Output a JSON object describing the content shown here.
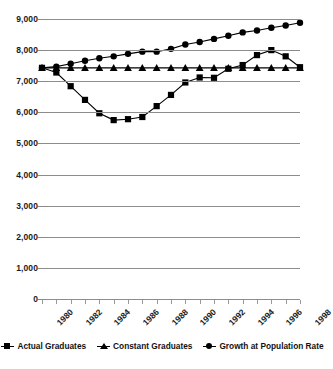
{
  "chart_data": {
    "type": "line",
    "title": "",
    "subtitle": "",
    "xlabel": "",
    "ylabel": "",
    "grid": true,
    "legend_position": "bottom",
    "x": [
      1980,
      1981,
      1982,
      1983,
      1984,
      1985,
      1986,
      1987,
      1988,
      1989,
      1990,
      1991,
      1992,
      1993,
      1994,
      1995,
      1996,
      1997,
      1998
    ],
    "categories": [
      "1980",
      "1981",
      "1982",
      "1983",
      "1984",
      "1985",
      "1986",
      "1987",
      "1988",
      "1989",
      "1990",
      "1991",
      "1992",
      "1993",
      "1994",
      "1995",
      "1996",
      "1997",
      "1998"
    ],
    "xtick_labels": [
      "1980",
      "1982",
      "1984",
      "1986",
      "1988",
      "1990",
      "1992",
      "1994",
      "1996",
      "1998"
    ],
    "xtick_values": [
      1980,
      1982,
      1984,
      1986,
      1988,
      1990,
      1992,
      1994,
      1996,
      1998
    ],
    "ytick_labels": [
      "9,000",
      "8,000",
      "7,000",
      "6,000",
      "5,000",
      "4,000",
      "3,000",
      "2,000",
      "1,000",
      "0"
    ],
    "ytick_values": [
      9000,
      8000,
      7000,
      6000,
      5000,
      4000,
      3000,
      2000,
      1000,
      0
    ],
    "ylim": [
      0,
      9000
    ],
    "xlim": [
      1980,
      1998
    ],
    "series": [
      {
        "name": "Actual Graduates",
        "marker": "square",
        "color": "#000000",
        "values": [
          7430,
          7280,
          6840,
          6400,
          5970,
          5750,
          5780,
          5850,
          6200,
          6560,
          6960,
          7120,
          7110,
          7400,
          7520,
          7840,
          8000,
          7800,
          7450
        ]
      },
      {
        "name": "Constant Graduates",
        "marker": "triangle",
        "color": "#000000",
        "values": [
          7430,
          7430,
          7430,
          7430,
          7430,
          7430,
          7430,
          7430,
          7430,
          7430,
          7430,
          7430,
          7430,
          7430,
          7430,
          7430,
          7430,
          7430,
          7430
        ]
      },
      {
        "name": "Growth at Population Rate",
        "marker": "diamond",
        "color": "#000000",
        "values": [
          7430,
          7470,
          7560,
          7660,
          7740,
          7800,
          7880,
          7950,
          7950,
          8040,
          8180,
          8260,
          8360,
          8460,
          8570,
          8630,
          8720,
          8790,
          8880
        ]
      }
    ]
  },
  "legend": {
    "items": [
      {
        "label": "Actual Graduates",
        "marker": "square"
      },
      {
        "label": "Constant Graduates",
        "marker": "triangle"
      },
      {
        "label": "Growth at Population Rate",
        "marker": "diamond"
      }
    ]
  }
}
